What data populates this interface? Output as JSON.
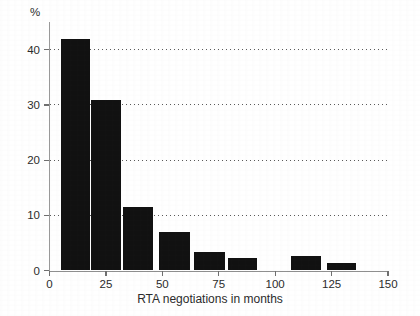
{
  "chart_data": {
    "type": "bar",
    "title": "",
    "subtitle": "",
    "xlabel": "RTA negotiations in months",
    "ylabel": "%",
    "unit_label": "%",
    "xlim": [
      0,
      150
    ],
    "ylim": [
      0,
      45
    ],
    "grid": "horizontal-dotted",
    "legend": "none",
    "bar_color": "#111111",
    "axis_color": "#8f8f8f",
    "grid_color": "#5a5a5a",
    "text_color": "#2b2b2b",
    "x_ticks": [
      0,
      25,
      50,
      75,
      100,
      125,
      150
    ],
    "x_tick_labels": [
      "0",
      "25",
      "50",
      "75",
      "100",
      "125",
      "150"
    ],
    "y_ticks": [
      0,
      10,
      20,
      30,
      40
    ],
    "y_tick_labels": [
      "0",
      "10",
      "20",
      "30",
      "40"
    ],
    "bin_width_months": 13.5,
    "bars": [
      {
        "x_start": 5.0,
        "x_end": 17.8,
        "x_center": 11.4,
        "value": 42.0,
        "label": "42.0"
      },
      {
        "x_start": 18.3,
        "x_end": 31.7,
        "x_center": 25.0,
        "value": 30.8,
        "label": "30.8"
      },
      {
        "x_start": 32.6,
        "x_end": 46.0,
        "x_center": 39.3,
        "value": 11.5,
        "label": "11.5"
      },
      {
        "x_start": 48.7,
        "x_end": 62.1,
        "x_center": 55.4,
        "value": 7.0,
        "label": "7.0"
      },
      {
        "x_start": 64.2,
        "x_end": 77.6,
        "x_center": 70.9,
        "value": 3.3,
        "label": "3.3"
      },
      {
        "x_start": 79.1,
        "x_end": 92.0,
        "x_center": 85.5,
        "value": 2.3,
        "label": "2.3"
      },
      {
        "x_start": 107.1,
        "x_end": 120.5,
        "x_center": 113.8,
        "value": 2.7,
        "label": "2.7"
      },
      {
        "x_start": 122.8,
        "x_end": 135.8,
        "x_center": 129.3,
        "value": 1.3,
        "label": "1.3"
      }
    ],
    "categories": [
      "5-18",
      "18-32",
      "33-46",
      "49-62",
      "64-78",
      "79-92",
      "107-120",
      "123-136"
    ],
    "values": [
      42.0,
      30.8,
      11.5,
      7.0,
      3.3,
      2.3,
      2.7,
      1.3
    ]
  }
}
